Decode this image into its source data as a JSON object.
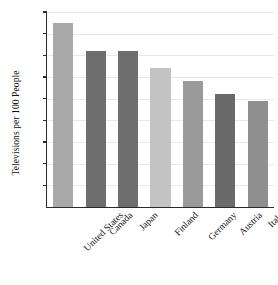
{
  "chart_data": {
    "type": "bar",
    "title": "",
    "xlabel": "",
    "ylabel": "Televisions per 100 People",
    "categories": [
      "United States",
      "Canada",
      "Japan",
      "Finland",
      "Germany",
      "Austria",
      "Italy"
    ],
    "values": [
      85,
      72,
      72,
      64,
      58,
      52,
      49
    ],
    "bar_colors": [
      "#a9a9a9",
      "#6e6e6e",
      "#6e6e6e",
      "#c3c3c3",
      "#9a9a9a",
      "#6a6a6a",
      "#8f8f8f"
    ],
    "ylim": [
      0,
      90
    ],
    "yticks": [
      10,
      20,
      30,
      40,
      50,
      60,
      70,
      80,
      90
    ],
    "ytick_labels": [
      "10",
      "20",
      "30",
      "40",
      "50",
      "60",
      "70",
      "80",
      "90"
    ],
    "grid": true,
    "grid_axis": "y",
    "legend": false,
    "legend_position": "none",
    "axis_color": "#2a2a2a",
    "grid_color": "#e8e8e8",
    "label_rotation_deg": -45
  }
}
